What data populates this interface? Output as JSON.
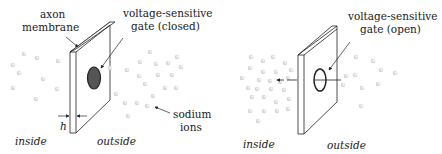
{
  "panels": [
    {
      "id": "closed",
      "labels": {
        "membrane_line1": "axon",
        "membrane_line2": "membrane",
        "gate_line1": "voltage-sensitive",
        "gate_line2": "gate (closed)",
        "ions_line1": "sodium",
        "ions_line2": "ions",
        "thickness": "h",
        "inside": "inside",
        "outside": "outside"
      },
      "gate_state": "closed",
      "gate_fill": "#555555"
    },
    {
      "id": "open",
      "labels": {
        "gate_line1": "voltage-sensitive",
        "gate_line2": "gate (open)",
        "inside": "inside",
        "outside": "outside"
      },
      "gate_state": "open",
      "gate_fill": "none"
    }
  ],
  "colors": {
    "line": "#222222",
    "ion": "#c8c8c8",
    "background": "#ffffff"
  }
}
